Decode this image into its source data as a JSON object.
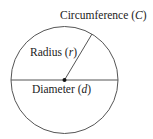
{
  "diagram": {
    "labels": {
      "circumference": {
        "text": "Circumference",
        "symbol": "C"
      },
      "radius": {
        "text": "Radius",
        "symbol": "r"
      },
      "diameter": {
        "text": "Diameter",
        "symbol": "d"
      }
    },
    "colors": {
      "stroke": "#555555",
      "text": "#222222",
      "center_dot": "#111111"
    }
  }
}
